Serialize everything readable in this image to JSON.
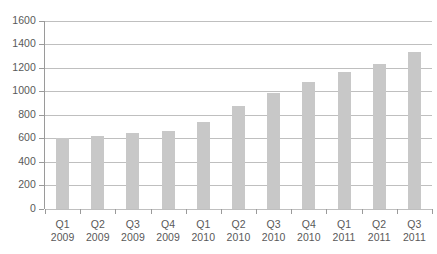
{
  "chart_data": {
    "type": "bar",
    "title": "",
    "subtitle": "",
    "xlabel": "",
    "ylabel": "",
    "categories": [
      "Q1 2009",
      "Q2 2009",
      "Q3 2009",
      "Q4 2009",
      "Q1 2010",
      "Q2 2010",
      "Q3 2010",
      "Q4 2010",
      "Q1 2011",
      "Q2 2011",
      "Q3 2011"
    ],
    "category_lines": [
      {
        "quarter": "Q1",
        "year": "2009"
      },
      {
        "quarter": "Q2",
        "year": "2009"
      },
      {
        "quarter": "Q3",
        "year": "2009"
      },
      {
        "quarter": "Q4",
        "year": "2009"
      },
      {
        "quarter": "Q1",
        "year": "2010"
      },
      {
        "quarter": "Q2",
        "year": "2010"
      },
      {
        "quarter": "Q3",
        "year": "2010"
      },
      {
        "quarter": "Q4",
        "year": "2010"
      },
      {
        "quarter": "Q1",
        "year": "2011"
      },
      {
        "quarter": "Q2",
        "year": "2011"
      },
      {
        "quarter": "Q3",
        "year": "2011"
      }
    ],
    "values": [
      600,
      620,
      640,
      660,
      735,
      875,
      985,
      1080,
      1160,
      1230,
      1330
    ],
    "ylim": [
      0,
      1600
    ],
    "ytick_step": 200,
    "yticks": [
      0,
      200,
      400,
      600,
      800,
      1000,
      1200,
      1400,
      1600
    ],
    "ytick_labels": [
      "0",
      "200",
      "400",
      "600",
      "800",
      "1000",
      "1200",
      "1400",
      "1600"
    ],
    "grid": true,
    "grid_axis": "y",
    "legend": false,
    "legend_position": "none",
    "series": [
      {
        "name": "",
        "values": [
          600,
          620,
          640,
          660,
          735,
          875,
          985,
          1080,
          1160,
          1230,
          1330
        ]
      }
    ],
    "colors": {
      "bar_fill": "#c8c8c8",
      "gridline": "#bfbfbf",
      "axis_line": "#9a9a9a",
      "tick_label": "#595959",
      "background": "#ffffff"
    }
  }
}
